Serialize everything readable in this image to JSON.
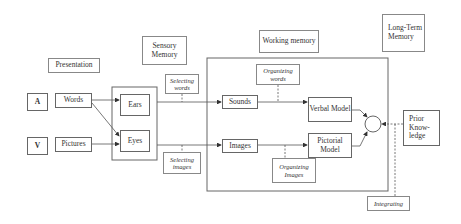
{
  "diagram": {
    "title_labels": {
      "presentation": "Presentation",
      "sensory_memory": "Sensory Memory",
      "working_memory": "Working memory",
      "long_term_memory": "Long-Term Memory"
    },
    "inputs": {
      "auditory": "A",
      "visual": "V",
      "words": "Words",
      "pictures": "Pictures"
    },
    "sensory": {
      "ears": "Ears",
      "eyes": "Eyes"
    },
    "processes": {
      "selecting_words": "Selecting words",
      "selecting_images": "Selecting images",
      "organizing_words": "Organizing words",
      "organizing_images": "Organizing Images",
      "integrating": "Integrating"
    },
    "working": {
      "sounds": "Sounds",
      "images": "Images",
      "verbal_model": "Verbal Model",
      "pictorial_model": "Pictorial Model"
    },
    "long_term": {
      "prior_knowledge": "Prior Know-ledge"
    },
    "colors": {
      "line": "#555555",
      "border": "#666666",
      "text": "#333333",
      "background": "#ffffff"
    }
  }
}
